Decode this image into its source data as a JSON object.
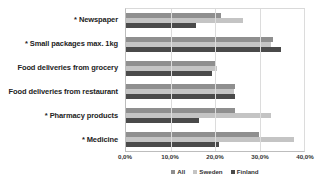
{
  "chart_data": {
    "type": "bar",
    "orientation": "horizontal",
    "title": "",
    "xlabel": "",
    "ylabel": "",
    "xlim": [
      0,
      40
    ],
    "xticks": [
      "0,0%",
      "10,0%",
      "20,0%",
      "30,0%",
      "40,0%"
    ],
    "xtick_values": [
      0,
      10,
      20,
      30,
      40
    ],
    "grid": true,
    "legend_position": "bottom",
    "categories": [
      "* Newspaper",
      "* Small packages max. 1kg",
      "Food deliveries from grocery",
      "Food deliveries from restaurant",
      "* Pharmacy products",
      "* Medicine"
    ],
    "series": [
      {
        "name": "All",
        "color": "#8f8f8f",
        "values": [
          21.3,
          33.0,
          20.0,
          24.5,
          24.5,
          29.8
        ]
      },
      {
        "name": "Sweden",
        "color": "#c4c4c4",
        "values": [
          26.3,
          32.5,
          20.5,
          24.2,
          32.5,
          37.8
        ]
      },
      {
        "name": "Finland",
        "color": "#4a4a4a",
        "values": [
          15.8,
          34.8,
          19.3,
          24.5,
          16.3,
          21.0
        ]
      }
    ]
  }
}
